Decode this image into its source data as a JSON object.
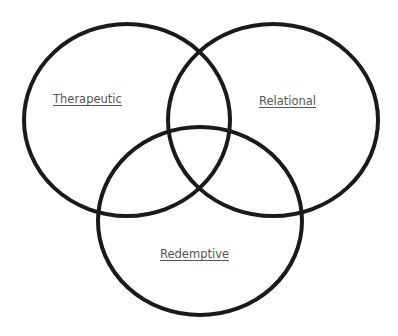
{
  "diagram": {
    "type": "venn",
    "stroke_color": "#1a1a1a",
    "label_color": "#555555",
    "background": "#ffffff",
    "sets": [
      {
        "id": "therapeutic",
        "label": "Therapeutic",
        "cx": 127,
        "cy": 120,
        "rx": 103,
        "ry": 96
      },
      {
        "id": "relational",
        "label": "Relational",
        "cx": 273,
        "cy": 120,
        "rx": 105,
        "ry": 96
      },
      {
        "id": "redemptive",
        "label": "Redemptive",
        "cx": 200,
        "cy": 221,
        "rx": 102,
        "ry": 94
      }
    ]
  }
}
